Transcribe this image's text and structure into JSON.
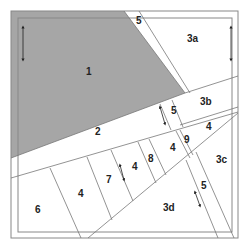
{
  "diagram": {
    "type": "paper-piecing quilt block pattern",
    "colors": {
      "shaded_piece": "#a6a6a6",
      "line": "#777777",
      "border": "#888888",
      "label": "#222222",
      "background": "#ffffff"
    },
    "pieces": [
      {
        "id": "1",
        "label": "1",
        "shaded": true
      },
      {
        "id": "2",
        "label": "2"
      },
      {
        "id": "3a",
        "label": "3a"
      },
      {
        "id": "3b",
        "label": "3b"
      },
      {
        "id": "3c",
        "label": "3c"
      },
      {
        "id": "3d",
        "label": "3d"
      },
      {
        "id": "4a",
        "label": "4"
      },
      {
        "id": "4b",
        "label": "4"
      },
      {
        "id": "4c",
        "label": "4"
      },
      {
        "id": "4d",
        "label": "4"
      },
      {
        "id": "5a",
        "label": "5"
      },
      {
        "id": "5b",
        "label": "5"
      },
      {
        "id": "5c",
        "label": "5"
      },
      {
        "id": "6",
        "label": "6"
      },
      {
        "id": "7",
        "label": "7"
      },
      {
        "id": "8",
        "label": "8"
      },
      {
        "id": "9",
        "label": "9"
      }
    ],
    "grain_arrows": [
      {
        "id": "arrow-piece-1",
        "orientation": "vertical"
      },
      {
        "id": "arrow-piece-3a",
        "orientation": "vertical"
      },
      {
        "id": "arrow-piece-5b",
        "orientation": "diagonal"
      },
      {
        "id": "arrow-piece-4c",
        "orientation": "diagonal"
      },
      {
        "id": "arrow-piece-5c",
        "orientation": "diagonal"
      }
    ]
  }
}
